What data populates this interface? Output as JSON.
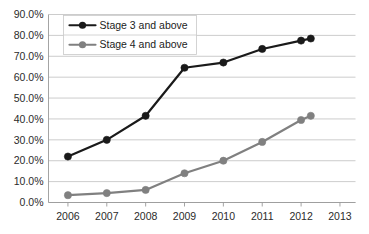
{
  "chart_data": {
    "type": "line",
    "title": "",
    "subtitle": "",
    "xlabel": "",
    "ylabel": "",
    "x": [
      2006,
      2007,
      2008,
      2009,
      2010,
      2011,
      2012,
      2012.25
    ],
    "categories": [
      "2006",
      "2007",
      "2008",
      "2009",
      "2010",
      "2011",
      "2012",
      "2013"
    ],
    "xtick_labels": [
      "2006",
      "2007",
      "2008",
      "2009",
      "2010",
      "2011",
      "2012",
      "2013"
    ],
    "xtick_values": [
      2006,
      2007,
      2008,
      2009,
      2010,
      2011,
      2012,
      2013
    ],
    "xlim": [
      2005.5,
      2013.4
    ],
    "ytick_labels": [
      "0.0%",
      "10.0%",
      "20.0%",
      "30.0%",
      "40.0%",
      "50.0%",
      "60.0%",
      "70.0%",
      "80.0%",
      "90.0%"
    ],
    "ytick_values": [
      0,
      10,
      20,
      30,
      40,
      50,
      60,
      70,
      80,
      90
    ],
    "ylim": [
      0,
      90
    ],
    "grid": "horizontal",
    "legend_position": "top-left-inside",
    "series": [
      {
        "name": "Stage 3 and above",
        "color": "#1a1a1a",
        "marker": "circle",
        "values": [
          22.0,
          30.0,
          41.5,
          64.5,
          67.0,
          73.5,
          77.5,
          78.5
        ]
      },
      {
        "name": "Stage 4 and above",
        "color": "#808080",
        "marker": "circle",
        "values": [
          3.5,
          4.5,
          6.0,
          14.0,
          20.0,
          29.0,
          39.5,
          41.5
        ]
      }
    ]
  },
  "legend": {
    "items": [
      {
        "label": "Stage 3 and above",
        "color": "#1a1a1a"
      },
      {
        "label": "Stage 4 and above",
        "color": "#808080"
      }
    ]
  },
  "colors": {
    "series_stage3": "#1a1a1a",
    "series_stage4": "#808080",
    "gridline": "#bfbfbf",
    "axis": "#9a9a9a",
    "text": "#2b2b2b",
    "background": "#ffffff"
  }
}
